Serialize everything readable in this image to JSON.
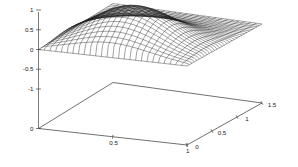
{
  "figure": {
    "type": "3d-mesh-surface-plot",
    "background_color": "#ffffff",
    "line_color": "#202020",
    "axis_color": "#444444",
    "width": 298,
    "height": 167
  },
  "chart_data": {
    "type": "surface",
    "title": "",
    "xlabel": "",
    "ylabel": "",
    "zlabel": "",
    "grid": false,
    "legend": false,
    "projection": "3d-wireframe-mesh",
    "x": {
      "label": "",
      "ticks": [
        "0",
        "0.5",
        "1"
      ],
      "tick_values": [
        0,
        0.5,
        1
      ],
      "range": [
        0,
        1
      ]
    },
    "y": {
      "label": "",
      "ticks": [
        "0",
        "0.5",
        "1",
        "1.5"
      ],
      "tick_values": [
        0,
        0.5,
        1,
        1.5
      ],
      "range": [
        0,
        1.5
      ]
    },
    "z": {
      "label": "",
      "ticks": [
        "-1",
        "-0.5",
        "0",
        "0.5",
        "1"
      ],
      "tick_values": [
        -1,
        -0.5,
        0,
        0.5,
        1
      ],
      "range": [
        -1,
        1
      ]
    },
    "surface": {
      "nx": 26,
      "ny": 30,
      "peak_value": 0.95,
      "peak_x": 0.5,
      "peak_y": 0.42,
      "baseline_value": 0.0,
      "description": "single smooth hump rising from a flat zero plane, maximum near z=0.95"
    },
    "origin_corner_label": "0"
  },
  "axes": {
    "z_axis": {
      "name": "vertical-axis",
      "ticks": [
        {
          "label": "1",
          "value": 1.0
        },
        {
          "label": "0.5",
          "value": 0.5
        },
        {
          "label": "0",
          "value": 0.0
        },
        {
          "label": "-0.5",
          "value": -0.5
        },
        {
          "label": "-1",
          "value": -1.0
        },
        {
          "label": "0",
          "value": -2.0
        }
      ]
    },
    "x_axis": {
      "name": "front-left-axis",
      "ticks": [
        {
          "label": "0.5",
          "value": 0.5
        },
        {
          "label": "1",
          "value": 1.0
        }
      ]
    },
    "y_axis": {
      "name": "front-right-axis",
      "ticks": [
        {
          "label": "0",
          "value": 0.0
        },
        {
          "label": "0.5",
          "value": 0.5
        },
        {
          "label": "1",
          "value": 1.0
        },
        {
          "label": "1.5",
          "value": 1.5
        }
      ]
    }
  }
}
